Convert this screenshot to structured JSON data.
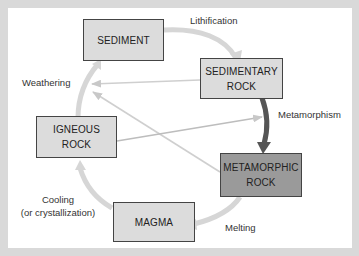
{
  "diagram": {
    "nodes": [
      {
        "id": "sediment",
        "label": "SEDIMENT"
      },
      {
        "id": "sedimentary_rock",
        "line1": "SEDIMENTARY",
        "line2": "ROCK"
      },
      {
        "id": "igneous_rock",
        "line1": "IGNEOUS",
        "line2": "ROCK"
      },
      {
        "id": "metamorphic_rock",
        "line1": "METAMORPHIC",
        "line2": "ROCK"
      },
      {
        "id": "magma",
        "label": "MAGMA"
      }
    ],
    "processes": {
      "lithification": "Lithification",
      "weathering": "Weathering",
      "metamorphism": "Metamorphism",
      "cooling_line1": "Cooling",
      "cooling_line2": "(or crystallization)",
      "melting": "Melting"
    },
    "edges": [
      {
        "from": "sediment",
        "to": "sedimentary_rock",
        "label": "Lithification"
      },
      {
        "from": "sedimentary_rock",
        "to": "metamorphic_rock",
        "label": "Metamorphism"
      },
      {
        "from": "metamorphic_rock",
        "to": "magma",
        "label": "Melting"
      },
      {
        "from": "magma",
        "to": "igneous_rock",
        "label": "Cooling (or crystallization)"
      },
      {
        "from": "igneous_rock",
        "to": "sediment",
        "label": "Weathering"
      },
      {
        "from": "sedimentary_rock",
        "to": "sediment",
        "label": "Weathering"
      },
      {
        "from": "metamorphic_rock",
        "to": "sediment",
        "label": "Weathering"
      },
      {
        "from": "igneous_rock",
        "to": "metamorphic_rock",
        "label": "Metamorphism"
      }
    ],
    "colors": {
      "background": "#d9d9d9",
      "panel": "#ffffff",
      "box_light": "#dcdcdc",
      "box_dark": "#9a9a9a",
      "cycle_arrow": "#d4d4d4",
      "metamorphism_arrow": "#555555"
    }
  }
}
